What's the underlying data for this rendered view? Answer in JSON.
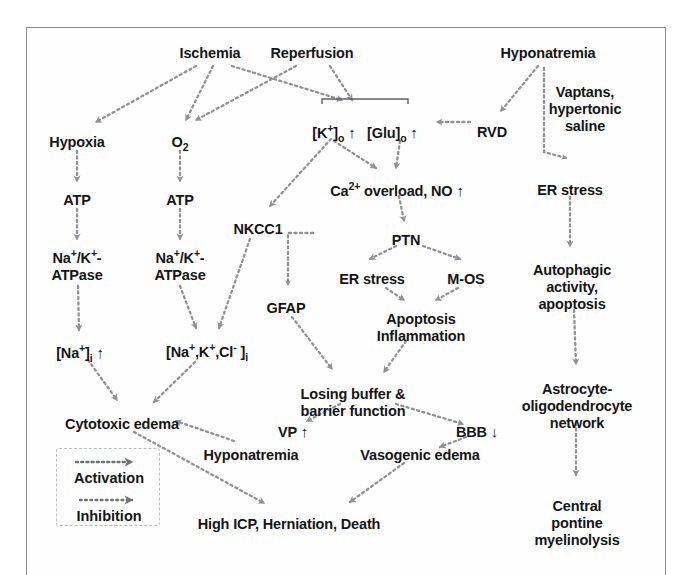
{
  "figure": {
    "type": "flow-diagram",
    "frame_color": "#8d9095",
    "text_color": "#141517",
    "arrow_color": "#8e9196",
    "background": "#ffffff"
  },
  "legend": {
    "activation_label": "Activation",
    "inhibition_label": "Inhibition",
    "activation_icon": "dotted-arrow-icon",
    "inhibition_icon": "dotted-arrow-icon"
  },
  "nodes": [
    {
      "id": "ischemia",
      "label": "Ischemia",
      "x": 210,
      "y": 45
    },
    {
      "id": "reperfusion",
      "label": "Reperfusion",
      "x": 312,
      "y": 45
    },
    {
      "id": "hyponatremia_t",
      "label": "Hyponatremia",
      "x": 548,
      "y": 45
    },
    {
      "id": "hypoxia",
      "label": "Hypoxia",
      "x": 77,
      "y": 134
    },
    {
      "id": "o2",
      "label": "O2",
      "x": 180,
      "y": 134
    },
    {
      "id": "k_glu",
      "label": "[K+]o ↑    [Glu]o ↑",
      "x": 365,
      "y": 124
    },
    {
      "id": "rvd",
      "label": "RVD",
      "x": 492,
      "y": 124
    },
    {
      "id": "vaptans",
      "label": "Vaptans,\nhypertonic\nsaline",
      "x": 585,
      "y": 84
    },
    {
      "id": "atp1",
      "label": "ATP",
      "x": 77,
      "y": 192
    },
    {
      "id": "atp2",
      "label": "ATP",
      "x": 180,
      "y": 192
    },
    {
      "id": "ca_no",
      "label": "Ca2+ overload, NO ↑",
      "x": 397,
      "y": 182
    },
    {
      "id": "er_stress_r",
      "label": "ER stress",
      "x": 570,
      "y": 182
    },
    {
      "id": "nkcc1",
      "label": "NKCC1",
      "x": 258,
      "y": 221
    },
    {
      "id": "ptn",
      "label": "PTN",
      "x": 406,
      "y": 232
    },
    {
      "id": "nak_atpase1",
      "label": "Na+/K+-\nATPase",
      "x": 77,
      "y": 250
    },
    {
      "id": "nak_atpase2",
      "label": "Na+/K+-\nATPase",
      "x": 180,
      "y": 250
    },
    {
      "id": "er_stress_m",
      "label": "ER stress",
      "x": 372,
      "y": 271
    },
    {
      "id": "m_os",
      "label": "M-OS",
      "x": 466,
      "y": 271
    },
    {
      "id": "autophagic",
      "label": "Autophagic\nactivity,\napoptosis",
      "x": 572,
      "y": 262
    },
    {
      "id": "gfap",
      "label": "GFAP",
      "x": 286,
      "y": 300
    },
    {
      "id": "apoptosis",
      "label": "Apoptosis\nInflammation",
      "x": 421,
      "y": 311
    },
    {
      "id": "na_i",
      "label": "[Na+]i ↑",
      "x": 80,
      "y": 344
    },
    {
      "id": "nakcl_i",
      "label": "[Na+,K+,Cl- ]i",
      "x": 207,
      "y": 344
    },
    {
      "id": "losing",
      "label": "Losing buffer &\nbarrier function",
      "x": 353,
      "y": 386
    },
    {
      "id": "astro",
      "label": "Astrocyte-\noligodendrocyte\nnetwork",
      "x": 577,
      "y": 381
    },
    {
      "id": "cytotoxic",
      "label": "Cytotoxic edema",
      "x": 122,
      "y": 416
    },
    {
      "id": "vp",
      "label": "VP ↑",
      "x": 293,
      "y": 423
    },
    {
      "id": "bbb",
      "label": "BBB ↓",
      "x": 477,
      "y": 423
    },
    {
      "id": "hyponatremia_b",
      "label": "Hyponatremia",
      "x": 251,
      "y": 447
    },
    {
      "id": "vasogenic",
      "label": "Vasogenic edema",
      "x": 420,
      "y": 447
    },
    {
      "id": "high_icp",
      "label": "High ICP, Herniation, Death",
      "x": 289,
      "y": 516
    },
    {
      "id": "cpm",
      "label": "Central pontine\nmyelinolysis",
      "x": 577,
      "y": 498
    }
  ],
  "edges": [
    {
      "from": "ischemia",
      "to": "hypoxia",
      "kind": "activation"
    },
    {
      "from": "ischemia",
      "to": "o2",
      "kind": "activation"
    },
    {
      "from": "ischemia",
      "to": "k_glu",
      "kind": "activation"
    },
    {
      "from": "reperfusion",
      "to": "o2",
      "kind": "activation"
    },
    {
      "from": "reperfusion",
      "to": "k_glu",
      "kind": "activation"
    },
    {
      "from": "hyponatremia_t",
      "to": "rvd",
      "kind": "activation"
    },
    {
      "from": "rvd",
      "to": "k_glu",
      "kind": "inhibition"
    },
    {
      "from": "vaptans",
      "to": "er_stress_r",
      "kind": "activation"
    },
    {
      "from": "hypoxia",
      "to": "atp1",
      "kind": "inhibition"
    },
    {
      "from": "o2",
      "to": "atp2",
      "kind": "inhibition"
    },
    {
      "from": "atp1",
      "to": "nak_atpase1",
      "kind": "inhibition"
    },
    {
      "from": "atp2",
      "to": "nak_atpase2",
      "kind": "inhibition"
    },
    {
      "from": "k_glu",
      "to": "nkcc1",
      "kind": "activation"
    },
    {
      "from": "k_glu",
      "to": "ca_no",
      "kind": "activation"
    },
    {
      "from": "ca_no",
      "to": "ptn",
      "kind": "activation"
    },
    {
      "from": "er_stress_r",
      "to": "autophagic",
      "kind": "activation"
    },
    {
      "from": "ptn",
      "to": "er_stress_m",
      "kind": "inhibition"
    },
    {
      "from": "ptn",
      "to": "m_os",
      "kind": "inhibition"
    },
    {
      "from": "ptn",
      "to": "gfap",
      "kind": "activation"
    },
    {
      "from": "er_stress_m",
      "to": "apoptosis",
      "kind": "activation"
    },
    {
      "from": "m_os",
      "to": "apoptosis",
      "kind": "activation"
    },
    {
      "from": "nak_atpase1",
      "to": "na_i",
      "kind": "activation"
    },
    {
      "from": "nak_atpase2",
      "to": "nakcl_i",
      "kind": "activation"
    },
    {
      "from": "nkcc1",
      "to": "nakcl_i",
      "kind": "activation"
    },
    {
      "from": "autophagic",
      "to": "astro",
      "kind": "activation"
    },
    {
      "from": "gfap",
      "to": "losing",
      "kind": "activation"
    },
    {
      "from": "apoptosis",
      "to": "losing",
      "kind": "activation"
    },
    {
      "from": "na_i",
      "to": "cytotoxic",
      "kind": "activation"
    },
    {
      "from": "nakcl_i",
      "to": "cytotoxic",
      "kind": "activation"
    },
    {
      "from": "losing",
      "to": "vp",
      "kind": "activation"
    },
    {
      "from": "losing",
      "to": "bbb",
      "kind": "inhibition"
    },
    {
      "from": "hyponatremia_b",
      "to": "cytotoxic",
      "kind": "activation"
    },
    {
      "from": "bbb",
      "to": "vasogenic",
      "kind": "activation"
    },
    {
      "from": "cytotoxic",
      "to": "high_icp",
      "kind": "activation"
    },
    {
      "from": "vasogenic",
      "to": "high_icp",
      "kind": "activation"
    },
    {
      "from": "astro",
      "to": "cpm",
      "kind": "activation"
    }
  ]
}
